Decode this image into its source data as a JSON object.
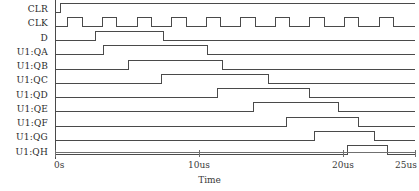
{
  "chart_data": {
    "type": "line",
    "title": "",
    "subtitle": "",
    "xlabel": "Time",
    "ylabel": "",
    "grid": false,
    "legend_position": "left-labels",
    "xlim": [
      0,
      25
    ],
    "x_unit": "us",
    "xticks": [
      0,
      10,
      20,
      25
    ],
    "xticklabels": [
      "0s",
      "10us",
      "20us",
      "25us"
    ],
    "signal_names": [
      "CLR",
      "CLK",
      "D",
      "U1:QA",
      "U1:QB",
      "U1:QC",
      "U1:QD",
      "U1:QE",
      "U1:QF",
      "U1:QG",
      "U1:QH"
    ],
    "series": [
      {
        "name": "CLR",
        "logic": true,
        "transitions": [
          {
            "t": 0.0,
            "v": 0
          },
          {
            "t": 0.35,
            "v": 1
          }
        ]
      },
      {
        "name": "CLK",
        "logic": true,
        "period_us": 2.4,
        "duty": 0.42,
        "transitions": [
          {
            "t": 0.0,
            "v": 0
          },
          {
            "t": 0.9,
            "v": 1
          },
          {
            "t": 1.9,
            "v": 0
          },
          {
            "t": 3.3,
            "v": 1
          },
          {
            "t": 4.3,
            "v": 0
          },
          {
            "t": 5.7,
            "v": 1
          },
          {
            "t": 6.7,
            "v": 0
          },
          {
            "t": 8.1,
            "v": 1
          },
          {
            "t": 9.1,
            "v": 0
          },
          {
            "t": 10.5,
            "v": 1
          },
          {
            "t": 11.5,
            "v": 0
          },
          {
            "t": 12.9,
            "v": 1
          },
          {
            "t": 13.9,
            "v": 0
          },
          {
            "t": 15.3,
            "v": 1
          },
          {
            "t": 16.3,
            "v": 0
          },
          {
            "t": 17.7,
            "v": 1
          },
          {
            "t": 18.7,
            "v": 0
          },
          {
            "t": 20.1,
            "v": 1
          },
          {
            "t": 21.1,
            "v": 0
          },
          {
            "t": 22.5,
            "v": 1
          },
          {
            "t": 23.5,
            "v": 0
          }
        ]
      },
      {
        "name": "D",
        "logic": true,
        "transitions": [
          {
            "t": 0.0,
            "v": 0
          },
          {
            "t": 2.8,
            "v": 1
          },
          {
            "t": 7.5,
            "v": 0
          }
        ]
      },
      {
        "name": "U1:QA",
        "logic": true,
        "transitions": [
          {
            "t": 0.0,
            "v": 0
          },
          {
            "t": 3.4,
            "v": 1
          },
          {
            "t": 10.6,
            "v": 0
          }
        ]
      },
      {
        "name": "U1:QB",
        "logic": true,
        "transitions": [
          {
            "t": 0.0,
            "v": 0
          },
          {
            "t": 5.1,
            "v": 1
          },
          {
            "t": 11.6,
            "v": 0
          }
        ]
      },
      {
        "name": "U1:QC",
        "logic": true,
        "transitions": [
          {
            "t": 0.0,
            "v": 0
          },
          {
            "t": 7.4,
            "v": 1
          },
          {
            "t": 14.8,
            "v": 0
          }
        ]
      },
      {
        "name": "U1:QD",
        "logic": true,
        "transitions": [
          {
            "t": 0.0,
            "v": 0
          },
          {
            "t": 11.3,
            "v": 1
          },
          {
            "t": 17.7,
            "v": 0
          }
        ]
      },
      {
        "name": "U1:QE",
        "logic": true,
        "transitions": [
          {
            "t": 0.0,
            "v": 0
          },
          {
            "t": 13.8,
            "v": 1
          },
          {
            "t": 19.7,
            "v": 0
          }
        ]
      },
      {
        "name": "U1:QF",
        "logic": true,
        "transitions": [
          {
            "t": 0.0,
            "v": 0
          },
          {
            "t": 16.1,
            "v": 1
          },
          {
            "t": 21.1,
            "v": 0
          }
        ]
      },
      {
        "name": "U1:QG",
        "logic": true,
        "transitions": [
          {
            "t": 0.0,
            "v": 0
          },
          {
            "t": 18.0,
            "v": 1
          },
          {
            "t": 22.2,
            "v": 0
          }
        ]
      },
      {
        "name": "U1:QH",
        "logic": true,
        "transitions": [
          {
            "t": 0.0,
            "v": 0
          },
          {
            "t": 20.3,
            "v": 1
          },
          {
            "t": 23.1,
            "v": 0
          }
        ]
      }
    ]
  },
  "axis": {
    "title": "Time",
    "ticks": [
      {
        "label": "0s",
        "value": 0
      },
      {
        "label": "10us",
        "value": 10
      },
      {
        "label": "20us",
        "value": 20
      },
      {
        "label": "25us",
        "value": 25
      }
    ]
  },
  "colors": {
    "trace": "#4a4a4a",
    "axis": "#707070",
    "text": "#2b2b2b",
    "background": "#ffffff"
  }
}
